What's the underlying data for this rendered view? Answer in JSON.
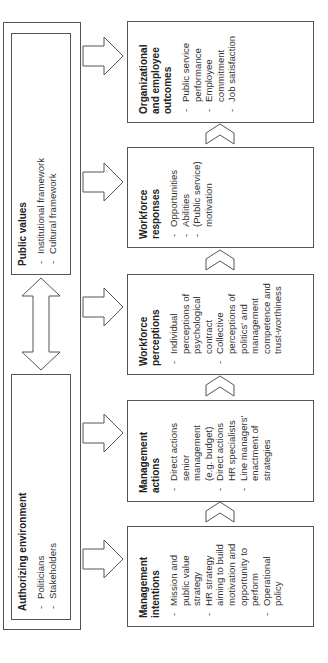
{
  "diagram": {
    "context": {
      "authorizing_environment": {
        "title": "Authorizing environment",
        "items": [
          "Politicians",
          "Stakeholders"
        ]
      },
      "public_values": {
        "title": "Public values",
        "items": [
          "Institutional framework",
          "Cultural framework"
        ]
      },
      "link": "double-headed-arrow"
    },
    "chain": [
      {
        "title": "Management intentions",
        "items": [
          "Mission and public value strategy",
          "HR strategy aiming to build motivation and opportunity to perform",
          "Operational policy"
        ]
      },
      {
        "title": "Management actions",
        "items": [
          "Direct actions senior management (e.g. budget)",
          "Direct actions HR specialists",
          "Line managers' enactment of strategies"
        ]
      },
      {
        "title": "Workforce perceptions",
        "items": [
          "Individual perceptions of psychological contract",
          "Collective perceptions of politics' and management competence and trust-worthiness"
        ]
      },
      {
        "title": "Workforce responses",
        "items": [
          "Opportunities",
          "Abilities",
          "(Public service) motivation"
        ]
      },
      {
        "title": "Organizational and employee outcomes",
        "items": [
          "Public service performance",
          "Employee commitment",
          "Job satisfaction"
        ]
      }
    ],
    "colors": {
      "stroke": "#555555",
      "text": "#2a2a2a",
      "background": "#ffffff"
    }
  }
}
